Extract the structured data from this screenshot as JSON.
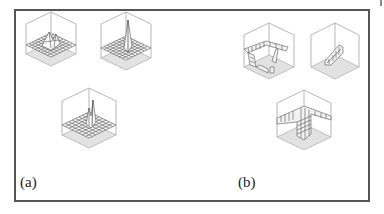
{
  "figure": {
    "panels": [
      {
        "label": "(a)",
        "description": "3D surface plots over a grid with single localized peaks",
        "plots": [
          {
            "id": "a1",
            "shape": "broad multi-peak bump"
          },
          {
            "id": "a2",
            "shape": "single sharp spike"
          },
          {
            "id": "a3",
            "shape": "narrow double spike"
          }
        ]
      },
      {
        "label": "(b)",
        "description": "3D surface plots with step/ridge structures",
        "plots": [
          {
            "id": "b1",
            "shape": "U-shaped raised ridge with gap"
          },
          {
            "id": "b2",
            "shape": "small diagonal ridge"
          },
          {
            "id": "b3",
            "shape": "wide plateau with step walls"
          }
        ]
      }
    ]
  },
  "colors": {
    "frame": "#555555",
    "box_edges": "#999999",
    "floor": "#e2e2e2",
    "mesh": "#555555",
    "surface": "#f4f4f4"
  }
}
